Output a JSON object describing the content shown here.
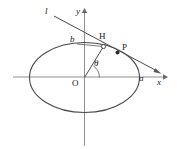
{
  "figure": {
    "kind": "geometry-diagram",
    "colors": {
      "ink": "#3a3a3a",
      "axis": "#8a8a8a",
      "label": "#1a1a1a",
      "background": "#ffffff"
    },
    "axes": {
      "x_label": "x",
      "y_label": "y",
      "origin_label": "O",
      "x_axis_y": 77,
      "y_axis_x": 84.5,
      "x_axis_from": 13,
      "x_axis_to": 166,
      "y_axis_from": 146,
      "y_axis_to": 10
    },
    "ellipse": {
      "center_x": 84.5,
      "center_y": 77.5,
      "semi_major_a": 55,
      "semi_minor_b": 35,
      "semi_major_label": "a",
      "semi_minor_label": "b"
    },
    "line": {
      "name_label": "l",
      "x1": 54,
      "y1": 16,
      "x2": 161,
      "y2": 73
    },
    "angle": {
      "label": "θ",
      "vertex_x": 84.5,
      "vertex_y": 77.5
    },
    "points": [
      {
        "label": "H",
        "marker": "open-circle",
        "x": 103.5,
        "y": 46.5
      },
      {
        "label": "P",
        "marker": "filled-dot",
        "x": 117.5,
        "y": 52.5
      }
    ],
    "labels": [
      {
        "name": "line-l-label",
        "text": "l",
        "style": "italic",
        "left": 45,
        "top": 8
      },
      {
        "name": "y-axis-label",
        "text": "y",
        "style": "italic",
        "left": 76,
        "top": 8
      },
      {
        "name": "x-axis-label",
        "text": "x",
        "style": "italic",
        "left": 158,
        "top": 78
      },
      {
        "name": "semi-minor-label",
        "text": "b",
        "style": "italic",
        "left": 70,
        "top": 36
      },
      {
        "name": "semi-major-label",
        "text": "a",
        "style": "italic",
        "left": 139,
        "top": 74
      },
      {
        "name": "origin-label",
        "text": "O",
        "style": "roman",
        "left": 73,
        "top": 79
      },
      {
        "name": "point-h-label",
        "text": "H",
        "style": "roman",
        "left": 99,
        "top": 33
      },
      {
        "name": "point-p-label",
        "text": "P",
        "style": "roman",
        "left": 122,
        "top": 44
      },
      {
        "name": "angle-theta-label",
        "text": "θ",
        "style": "italic",
        "left": 94,
        "top": 60
      }
    ]
  }
}
